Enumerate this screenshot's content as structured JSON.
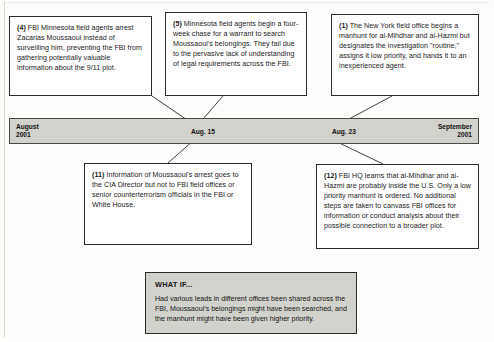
{
  "diagram": {
    "type": "timeline-with-callouts",
    "title_present": false
  },
  "timeline": {
    "start_label": "August\n2001",
    "end_label": "September\n2001",
    "markers": [
      {
        "label": "Aug. 15"
      },
      {
        "label": "Aug. 23"
      }
    ]
  },
  "callouts_above": [
    {
      "number": "(4)",
      "text": " FBI Minnesota field agents arrest Zacarias Moussaoui instead of surveilling him, preventing the FBI from gathering  potentially valuable information about the 9/11 plot."
    },
    {
      "number": "(5)",
      "text": " Minnesota field agents begin a four-week chase for a warrant to search Moussaoui's belongings.  They fail due to the pervasive lack of understanding of legal requirements across the FBI."
    },
    {
      "number": "(1)",
      "text": " The New York field office begins a manhunt for al-Mihdhar and al-Hazmi but designates the investigation \"routine,\" assigns it low priority, and hands it to an inexperienced agent."
    }
  ],
  "callouts_below": [
    {
      "number": "(11)",
      "text": " Information of Moussaoui's arrest goes to the CIA Director but not to FBI field offices or senior counterterrorism officials in the FBI or White House."
    },
    {
      "number": "(12)",
      "text": " FBI HQ learns that al-Mihdhar and al-Hazmi are probably inside the U.S. Only a low priority manhunt is ordered. No additional steps are taken to canvass FBI offices for information or conduct analysis about their possible connection to a broader plot."
    }
  ],
  "what_if": {
    "title": "WHAT IF...",
    "body": "Had various leads in different offices been shared across the FBI, Moussaoui's belongings might have been searched, and the manhunt might have been given higher priority."
  },
  "colors": {
    "bar_fill": "#d2d2cd",
    "box_border": "#2b2b2b",
    "text": "#1a1a1a",
    "page_background": "#fdfdfb"
  }
}
